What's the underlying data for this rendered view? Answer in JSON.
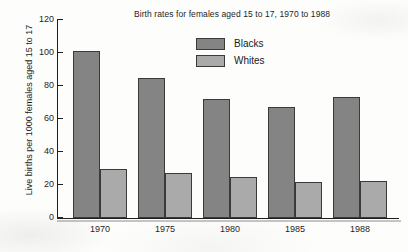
{
  "chart_data": {
    "type": "bar",
    "title": "Birth rates for females aged 15 to 17, 1970 to 1988",
    "xlabel": "",
    "ylabel": "Live births per 1000 females aged 15 to 17",
    "categories": [
      "1970",
      "1975",
      "1980",
      "1985",
      "1988"
    ],
    "series": [
      {
        "name": "Blacks",
        "color": "#848484",
        "values": [
          101,
          85,
          72,
          67,
          73.5
        ]
      },
      {
        "name": "Whites",
        "color": "#aaaaaa",
        "values": [
          29.5,
          27,
          25,
          22,
          22.5
        ]
      }
    ],
    "ylim": [
      0,
      120
    ],
    "yticks": [
      0,
      20,
      40,
      60,
      80,
      100,
      120
    ],
    "ytick_labels": [
      "0",
      "20",
      "40",
      "60",
      "80",
      "100",
      "120"
    ],
    "grid": false,
    "legend_position": "upper center",
    "legend_entries": [
      "Blacks",
      "Whites"
    ]
  }
}
